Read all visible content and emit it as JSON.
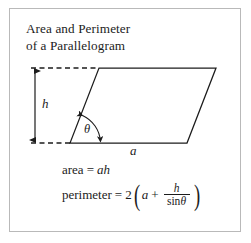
{
  "figure": {
    "title_line1": "Area and Perimeter",
    "title_line2": "of a Parallelogram",
    "frame_color": "#b9b9b9",
    "ink_color": "#1c1c1c",
    "background": "#ffffff"
  },
  "diagram": {
    "shape": "parallelogram",
    "labels": {
      "height": "h",
      "base": "a",
      "angle": "θ"
    },
    "vertices": {
      "bottom_left": [
        70,
        143
      ],
      "bottom_right": [
        187,
        143
      ],
      "top_right": [
        216,
        68
      ],
      "top_left": [
        99,
        68
      ]
    },
    "height_arrow": {
      "x": 35,
      "y_top": 68,
      "y_bottom": 143,
      "style": "double-headed"
    },
    "dashed_guides": [
      {
        "y": 68,
        "x_start": 31,
        "x_end": 99
      },
      {
        "y": 143,
        "x_start": 31,
        "x_end": 70
      }
    ],
    "angle_arc": {
      "center": [
        70,
        143
      ],
      "radius": 30,
      "style": "double-headed-arc"
    }
  },
  "formulas": {
    "area": {
      "label": "area",
      "equals": "=",
      "expression": "ah",
      "var_a": "a",
      "var_h": "h"
    },
    "perimeter": {
      "label": "perimeter",
      "equals": "=",
      "coefficient": "2",
      "open_paren": "(",
      "close_paren": ")",
      "term_a": "a",
      "plus": "+",
      "fraction_numerator": "h",
      "fraction_denominator_fn": "sin",
      "fraction_denominator_var": "θ"
    }
  }
}
